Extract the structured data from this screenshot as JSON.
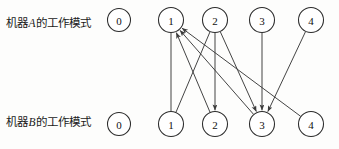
{
  "figure": {
    "type": "state-transition-diagram",
    "background_color": "#fdfdfc",
    "stroke_color": "#3a3a3a",
    "node_fill": "#ffffff",
    "node_stroke": "#2b2b2b"
  },
  "rows": {
    "machine_a": {
      "label_prefix": "机器",
      "label_var": "A",
      "label_suffix": "的工作模式",
      "label_full": "机器A的工作模式",
      "standalone_state": "0",
      "states": [
        "1",
        "2",
        "3",
        "4"
      ]
    },
    "machine_b": {
      "label_prefix": "机器",
      "label_var": "B",
      "label_suffix": "的工作模式",
      "label_full": "机器B的工作模式",
      "standalone_state": "0",
      "states": [
        "1",
        "2",
        "3",
        "4"
      ]
    }
  },
  "nodes": {
    "top": [
      {
        "id": "a0",
        "label": "0",
        "cx": 119,
        "cy": 20,
        "r": 11.5,
        "detached": true
      },
      {
        "id": "a1",
        "label": "1",
        "cx": 171,
        "cy": 20,
        "r": 12.5,
        "detached": false
      },
      {
        "id": "a2",
        "label": "2",
        "cx": 215,
        "cy": 20,
        "r": 12.5,
        "detached": false
      },
      {
        "id": "a3",
        "label": "3",
        "cx": 262,
        "cy": 20,
        "r": 12.5,
        "detached": false
      },
      {
        "id": "a4",
        "label": "4",
        "cx": 311,
        "cy": 20,
        "r": 12.5,
        "detached": false
      }
    ],
    "bottom": [
      {
        "id": "b0",
        "label": "0",
        "cx": 119,
        "cy": 124,
        "r": 11.5,
        "detached": true
      },
      {
        "id": "b1",
        "label": "1",
        "cx": 171,
        "cy": 124,
        "r": 12.5,
        "detached": false
      },
      {
        "id": "b2",
        "label": "2",
        "cx": 215,
        "cy": 124,
        "r": 12.5,
        "detached": false
      },
      {
        "id": "b3",
        "label": "3",
        "cx": 262,
        "cy": 124,
        "r": 12.5,
        "detached": false
      },
      {
        "id": "b4",
        "label": "4",
        "cx": 311,
        "cy": 124,
        "r": 12.5,
        "detached": false
      }
    ]
  },
  "edges": [
    {
      "name": "a1-to-b1",
      "from": "a1",
      "to": "b1",
      "direction": "down",
      "arrow": false
    },
    {
      "name": "a2-to-b1",
      "from": "a2",
      "to": "b1",
      "direction": "down",
      "arrow": false
    },
    {
      "name": "a2-to-b2",
      "from": "a2",
      "to": "b2",
      "direction": "down",
      "arrow": true
    },
    {
      "name": "a2-to-b3",
      "from": "a2",
      "to": "b3",
      "direction": "down",
      "arrow": true
    },
    {
      "name": "a3-to-b3",
      "from": "a3",
      "to": "b3",
      "direction": "down",
      "arrow": true
    },
    {
      "name": "a4-to-b3",
      "from": "a4",
      "to": "b3",
      "direction": "down",
      "arrow": true
    },
    {
      "name": "b2-to-a1",
      "from": "b2",
      "to": "a1",
      "direction": "up",
      "arrow": true
    },
    {
      "name": "b3-to-a1",
      "from": "b3",
      "to": "a1",
      "direction": "up",
      "arrow": true
    },
    {
      "name": "b4-to-a1",
      "from": "b4",
      "to": "a1",
      "direction": "up",
      "arrow": true
    }
  ]
}
